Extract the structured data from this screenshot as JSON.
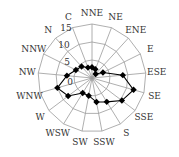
{
  "chart_data": {
    "type": "radar",
    "title": "",
    "categories": [
      "NNE",
      "NE",
      "ENE",
      "E",
      "ESE",
      "SE",
      "SSE",
      "S",
      "SSW",
      "SW",
      "WSW",
      "W",
      "WNW",
      "NW",
      "NNW",
      "N",
      "C"
    ],
    "series": [
      {
        "name": "Wind frequency",
        "values": [
          3.0,
          2.6,
          1.5,
          3.4,
          8.6,
          12.0,
          10.4,
          7.8,
          6.8,
          5.0,
          4.9,
          8.3,
          10.0,
          7.0,
          5.0,
          4.3,
          3.1
        ],
        "marker": "diamond",
        "color": "#000000"
      }
    ],
    "radial_ticks": [
      0,
      5,
      10,
      15
    ],
    "radial_range": [
      0,
      15
    ],
    "grid": true,
    "legend": "none"
  },
  "colors": {
    "grid": "#9a9a9a",
    "series": "#000000",
    "background": "#ffffff"
  }
}
